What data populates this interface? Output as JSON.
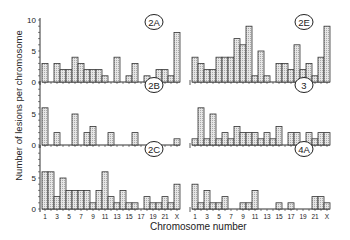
{
  "chart_data": [
    {
      "type": "bar",
      "title": "2A",
      "xlabel": "Chromosome number",
      "ylabel": "Number of lesions per chromosome",
      "ylim": [
        0,
        10
      ],
      "categories": [
        "1",
        "2",
        "3",
        "4",
        "5",
        "6",
        "7",
        "8",
        "9",
        "10",
        "11",
        "12",
        "13",
        "14",
        "15",
        "16",
        "17",
        "18",
        "19",
        "20",
        "21",
        "22",
        "X"
      ],
      "values": [
        3,
        0,
        3,
        2,
        2,
        4,
        3,
        2,
        2,
        2,
        1,
        0,
        4,
        0,
        1,
        3,
        0,
        1,
        0,
        2,
        2,
        1,
        8
      ]
    },
    {
      "type": "bar",
      "title": "2E",
      "xlabel": "Chromosome number",
      "ylabel": "Number of lesions per chromosome",
      "ylim": [
        0,
        10
      ],
      "categories": [
        "1",
        "2",
        "3",
        "4",
        "5",
        "6",
        "7",
        "8",
        "9",
        "10",
        "11",
        "12",
        "13",
        "14",
        "15",
        "16",
        "17",
        "18",
        "19",
        "20",
        "21",
        "22",
        "X"
      ],
      "values": [
        4,
        3,
        2,
        2,
        4,
        4,
        4,
        7,
        6,
        9,
        1,
        5,
        1,
        0,
        3,
        3,
        2,
        6,
        2,
        3,
        1,
        4,
        9
      ]
    },
    {
      "type": "bar",
      "title": "2B",
      "xlabel": "Chromosome number",
      "ylabel": "Number of lesions per chromosome",
      "ylim": [
        0,
        10
      ],
      "categories": [
        "1",
        "2",
        "3",
        "4",
        "5",
        "6",
        "7",
        "8",
        "9",
        "10",
        "11",
        "12",
        "13",
        "14",
        "15",
        "16",
        "17",
        "18",
        "19",
        "20",
        "21",
        "22",
        "X"
      ],
      "values": [
        6,
        0,
        2,
        0,
        0,
        5,
        0,
        2,
        3,
        0,
        0,
        2,
        0,
        0,
        0,
        2,
        0,
        0,
        0,
        0,
        0,
        0,
        1
      ]
    },
    {
      "type": "bar",
      "title": "3",
      "xlabel": "Chromosome number",
      "ylabel": "Number of lesions per chromosome",
      "ylim": [
        0,
        10
      ],
      "categories": [
        "1",
        "2",
        "3",
        "4",
        "5",
        "6",
        "7",
        "8",
        "9",
        "10",
        "11",
        "12",
        "13",
        "14",
        "15",
        "16",
        "17",
        "18",
        "19",
        "20",
        "21",
        "22",
        "X"
      ],
      "values": [
        1,
        6,
        1,
        5,
        1,
        2,
        1,
        3,
        2,
        2,
        2,
        1,
        2,
        1,
        3,
        0,
        2,
        2,
        0,
        2,
        1,
        2,
        2
      ]
    },
    {
      "type": "bar",
      "title": "2C",
      "xlabel": "Chromosome number",
      "ylabel": "Number of lesions per chromosome",
      "ylim": [
        0,
        10
      ],
      "categories": [
        "1",
        "2",
        "3",
        "4",
        "5",
        "6",
        "7",
        "8",
        "9",
        "10",
        "11",
        "12",
        "13",
        "14",
        "15",
        "16",
        "17",
        "18",
        "19",
        "20",
        "21",
        "22",
        "X"
      ],
      "values": [
        6,
        6,
        2,
        5,
        3,
        3,
        3,
        3,
        1,
        3,
        6,
        2,
        1,
        3,
        1,
        1,
        0,
        2,
        1,
        1,
        2,
        1,
        4
      ]
    },
    {
      "type": "bar",
      "title": "4A",
      "xlabel": "Chromosome number",
      "ylabel": "Number of lesions per chromosome",
      "ylim": [
        0,
        10
      ],
      "categories": [
        "1",
        "2",
        "3",
        "4",
        "5",
        "6",
        "7",
        "8",
        "9",
        "10",
        "11",
        "12",
        "13",
        "14",
        "15",
        "16",
        "17",
        "18",
        "19",
        "20",
        "21",
        "22",
        "X"
      ],
      "values": [
        4,
        1,
        3,
        1,
        1,
        2,
        0,
        0,
        1,
        1,
        3,
        0,
        0,
        0,
        1,
        0,
        1,
        0,
        0,
        0,
        2,
        2,
        1
      ]
    }
  ],
  "labels": {
    "xlabel": "Chromosome number",
    "ylabel": "Number of lesions per chromosome",
    "xticks": [
      "1",
      "3",
      "5",
      "7",
      "9",
      "11",
      "13",
      "15",
      "17",
      "19",
      "21",
      "X"
    ],
    "yticks": [
      "0",
      "5",
      "10"
    ]
  }
}
